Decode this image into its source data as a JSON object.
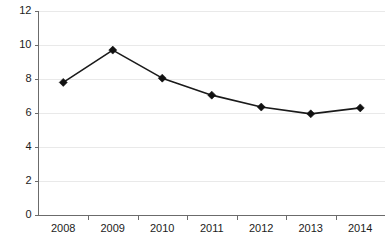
{
  "chart_data": {
    "type": "line",
    "title": "",
    "subtitle": "",
    "xlabel": "",
    "ylabel": "",
    "categories": [
      "2008",
      "2009",
      "2010",
      "2011",
      "2012",
      "2013",
      "2014"
    ],
    "values": [
      7.8,
      9.7,
      8.05,
      7.05,
      6.35,
      5.95,
      6.3
    ],
    "series": [
      {
        "name": "",
        "values": [
          7.8,
          9.7,
          8.05,
          7.05,
          6.35,
          5.95,
          6.3
        ]
      }
    ],
    "ylim": [
      0,
      12
    ],
    "ytick_values": [
      0,
      2,
      4,
      6,
      8,
      10,
      12
    ],
    "ytick_labels": [
      "0",
      "2",
      "4",
      "6",
      "8",
      "10",
      "12"
    ],
    "xtick_labels": [
      "2008",
      "2009",
      "2010",
      "2011",
      "2012",
      "2013",
      "2014"
    ],
    "grid": true,
    "grid_axis": "y",
    "legend": false,
    "legend_position": "none",
    "marker": "diamond",
    "line_color": "#1a1a1a",
    "marker_color": "#111111",
    "grid_color": "#e9e9e9",
    "axis_color": "#6b6b6b",
    "background_color": "#ffffff",
    "annotations": []
  }
}
